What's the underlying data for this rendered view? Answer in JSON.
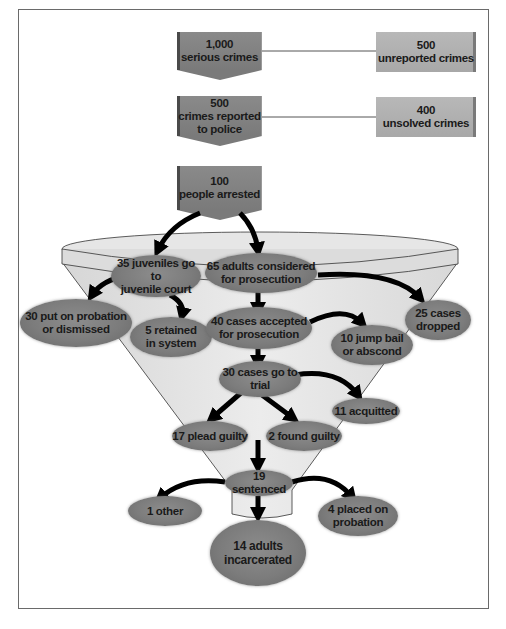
{
  "diagram": {
    "colors": {
      "dark_box": "#7f7f7f",
      "light_box": "#ababab",
      "oval": "#7c7c7c",
      "funnel": "#e2e2e2",
      "arrow": "#000000",
      "text": "#1a1a1a"
    },
    "stages": {
      "serious_crimes": {
        "count": "1,000",
        "label": "serious crimes"
      },
      "unreported": {
        "count": "500",
        "label": "unreported crimes"
      },
      "reported": {
        "count": "500",
        "label1": "crimes reported",
        "label2": "to police"
      },
      "unsolved": {
        "count": "400",
        "label": "unsolved crimes"
      },
      "arrested": {
        "count": "100",
        "label": "people arrested"
      },
      "juveniles": {
        "line1": "35 juveniles go to",
        "line2": "juvenile court"
      },
      "adults": {
        "line1": "65 adults considered",
        "line2": "for prosecution"
      },
      "probation_dismissed": {
        "line1": "30 put on probation",
        "line2": "or dismissed"
      },
      "retained": {
        "line1": "5 retained",
        "line2": "in system"
      },
      "accepted": {
        "line1": "40 cases accepted",
        "line2": "for prosecution"
      },
      "dropped": {
        "line1": "25 cases",
        "line2": "dropped"
      },
      "jump_bail": {
        "line1": "10 jump bail",
        "line2": "or abscond"
      },
      "trial": {
        "line1": "30 cases go to",
        "line2": "trial"
      },
      "acquitted": {
        "line1": "11 acquitted"
      },
      "plead_guilty": {
        "line1": "17 plead guilty"
      },
      "found_guilty": {
        "line1": "2 found guilty"
      },
      "sentenced": {
        "line1": "19 sentenced"
      },
      "other": {
        "line1": "1 other"
      },
      "placed_probation": {
        "line1": "4 placed on",
        "line2": "probation"
      },
      "incarcerated": {
        "line1": "14 adults",
        "line2": "incarcerated"
      }
    }
  }
}
